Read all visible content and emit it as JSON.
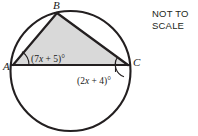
{
  "figure": {
    "type": "circle-geometry-inscribed-triangle",
    "background_color": "#ffffff",
    "stroke_color": "#231f20",
    "triangle_fill_color": "#d9d9d9",
    "circle": {
      "center_x": 70.5,
      "center_y": 71,
      "radius": 60
    },
    "vertices": [
      {
        "name": "A",
        "label": "A",
        "x": 13,
        "y": 65,
        "label_x": 4,
        "label_y": 69
      },
      {
        "name": "B",
        "label": "B",
        "x": 57,
        "y": 13,
        "label_x": 53,
        "label_y": 9
      },
      {
        "name": "C",
        "label": "C",
        "x": 128,
        "y": 65,
        "label_x": 133,
        "label_y": 65
      }
    ],
    "angles": [
      {
        "name": "angle-at-a",
        "at_vertex": "A",
        "text": "(7x + 5)°",
        "prefix": "(7",
        "variable": "x",
        "suffix": " + 5)°",
        "label_x": 31,
        "label_y": 62,
        "arc_radius": 16
      },
      {
        "name": "angle-at-c",
        "at_vertex": "C",
        "text": "(2x + 4)°",
        "prefix": "(2",
        "variable": "x",
        "suffix": " + 4)°",
        "label_x": 77,
        "label_y": 84,
        "arc_radius": 13
      }
    ],
    "segments": [
      {
        "name": "chord-ab",
        "from": "A",
        "to": "B"
      },
      {
        "name": "chord-bc",
        "from": "B",
        "to": "C"
      },
      {
        "name": "chord-ac",
        "from": "A",
        "to": "C"
      }
    ]
  },
  "note": {
    "text": "NOT TO\nSCALE"
  }
}
